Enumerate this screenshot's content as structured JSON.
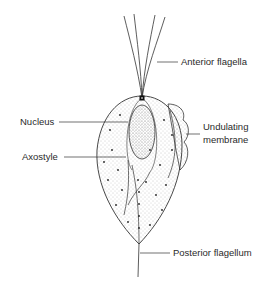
{
  "diagram": {
    "colors": {
      "ink": "#2a2a2a",
      "stipple": "#9a9a9a",
      "background": "#ffffff"
    },
    "labels": {
      "anterior_flagella": "Anterior flagella",
      "nucleus": "Nucleus",
      "undulating_membrane_line1": "Undulating",
      "undulating_membrane_line2": "membrane",
      "axostyle": "Axostyle",
      "posterior_flagellum": "Posterior flagellum"
    }
  }
}
